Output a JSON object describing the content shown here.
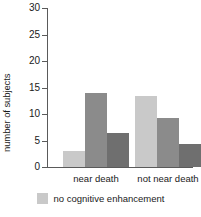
{
  "chart_data": {
    "type": "bar",
    "title": "",
    "subtitle": "",
    "xlabel": "",
    "ylabel": "number of subjects",
    "categories": [
      "near death",
      "not near death"
    ],
    "series": [
      {
        "name": "no cognitive enhancement",
        "color": "#c9c9c9",
        "values": [
          3,
          13.4
        ]
      },
      {
        "name": "series-2",
        "color": "#8b8b8b",
        "values": [
          14,
          9.2
        ]
      },
      {
        "name": "series-3",
        "color": "#6f6f6f",
        "values": [
          6.5,
          4.3
        ]
      }
    ],
    "ylim": [
      0,
      30
    ],
    "yticks": [
      0,
      5,
      10,
      15,
      20,
      25,
      30
    ],
    "ytick_labels": [
      "0",
      "5",
      "10",
      "15",
      "20",
      "25",
      "30"
    ],
    "grid": false,
    "legend_position": "bottom",
    "legend": [
      {
        "label": "no cognitive enhancement",
        "color": "#c9c9c9"
      }
    ]
  },
  "axis": {
    "line_color": "#5a5a5a"
  }
}
